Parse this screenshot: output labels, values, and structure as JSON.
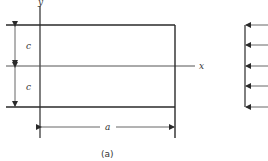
{
  "figure": {
    "caption": "(a)",
    "labels": {
      "y_axis": "y",
      "x_axis": "x",
      "upper_half": "c",
      "lower_half": "c",
      "width": "a"
    },
    "plate": {
      "left": 40,
      "top": 25,
      "right": 175,
      "bottom": 107,
      "mid_y": 66
    },
    "load_panel": {
      "x": 245,
      "arrow_ys": [
        25,
        45,
        66,
        86,
        107
      ],
      "direction": "left"
    },
    "colors": {
      "line": "#2a2a2a",
      "thin": "#555555",
      "background": "#ffffff"
    }
  }
}
